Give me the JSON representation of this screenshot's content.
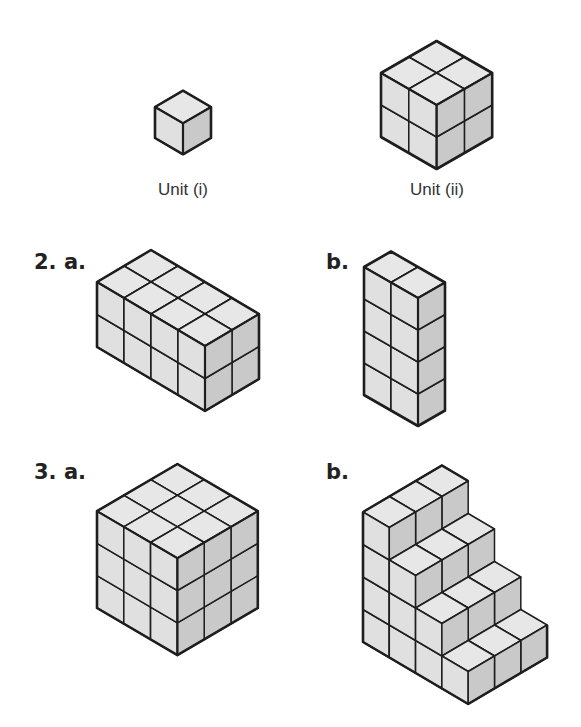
{
  "colors": {
    "top": "#e7e7e7",
    "left": "#e0e0e0",
    "right": "#c9c9c9",
    "edge": "#1e1e1e"
  },
  "captions": [
    {
      "id": "unit-i-caption",
      "text": "Unit (i)",
      "x": 183,
      "y": 180
    },
    {
      "id": "unit-ii-caption",
      "text": "Unit (ii)",
      "x": 437,
      "y": 180
    }
  ],
  "labels": [
    {
      "id": "q2a-label",
      "text": "2. a.",
      "x": 34,
      "y": 250
    },
    {
      "id": "q2b-label",
      "text": "b.",
      "x": 326,
      "y": 250
    },
    {
      "id": "q3a-label",
      "text": "3. a.",
      "x": 34,
      "y": 460
    },
    {
      "id": "q3b-label",
      "text": "b.",
      "x": 326,
      "y": 460
    }
  ],
  "figures": [
    {
      "id": "unit-i-cube",
      "name": "Unit (i)",
      "origin": [
        155,
        138
      ],
      "dx": 28,
      "dy": 16.3,
      "h": 31,
      "box": [
        1,
        1,
        1
      ]
    },
    {
      "id": "unit-ii-cube",
      "name": "Unit (ii)",
      "origin": [
        381,
        137
      ],
      "dx": 27.8,
      "dy": 16,
      "h": 32,
      "box": [
        2,
        2,
        2
      ]
    },
    {
      "id": "q2a-prism",
      "name": "2. a. 4x2x2 prism",
      "origin": [
        97,
        347
      ],
      "dx": 27,
      "dy": 16,
      "h": 32.5,
      "box": [
        4,
        2,
        2
      ]
    },
    {
      "id": "q2b-prism",
      "name": "b. 2x1x4 prism",
      "origin": [
        364,
        395
      ],
      "dx": 27,
      "dy": 15.5,
      "h": 32,
      "box": [
        2,
        1,
        4
      ]
    },
    {
      "id": "q3a-cube",
      "name": "3. a. 3x3x3 cube",
      "origin": [
        97,
        608
      ],
      "dx": 26.8,
      "dy": 15.7,
      "h": 32.3,
      "box": [
        3,
        3,
        3
      ]
    },
    {
      "id": "q3b-stairs",
      "name": "b. staircase",
      "origin": [
        363,
        642
      ],
      "dx": 26.3,
      "dy": 15.5,
      "h": 32.5,
      "stairs": {
        "columns_u": 4,
        "depth_v": 3,
        "heights": [
          4,
          3,
          2,
          1
        ]
      }
    }
  ]
}
